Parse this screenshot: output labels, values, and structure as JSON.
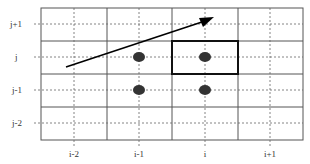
{
  "diagram": {
    "type": "stencil-grid",
    "row_labels": [
      "j+1",
      "j",
      "j-1",
      "j-2"
    ],
    "col_labels": [
      "i-2",
      "i-1",
      "i",
      "i+1"
    ],
    "colors": {
      "grid_solid": "#555555",
      "grid_dashed": "#666666",
      "highlight_box": "#111111",
      "points": "#333333",
      "arrow": "#000000"
    },
    "points": [
      {
        "col": "i-1",
        "row": "j"
      },
      {
        "col": "i",
        "row": "j"
      },
      {
        "col": "i-1",
        "row": "j-1"
      },
      {
        "col": "i",
        "row": "j-1"
      }
    ],
    "highlight_cell": {
      "col": "i",
      "row": "j"
    },
    "arrow": {
      "description": "direction vector pointing up-right from left of (i-2, j) toward (i, j+1)"
    }
  }
}
